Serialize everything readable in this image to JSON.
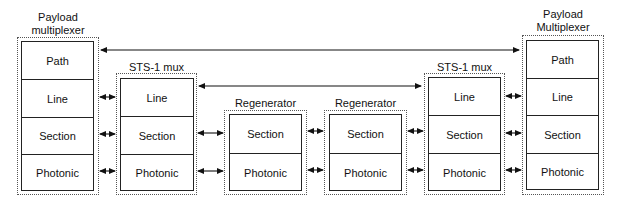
{
  "diagram": {
    "nodes": [
      {
        "id": "pm_left",
        "title_lines": [
          "Payload",
          "multiplexer"
        ],
        "layers": [
          "Path",
          "Line",
          "Section",
          "Photonic"
        ]
      },
      {
        "id": "mux_left",
        "title_lines": [
          "STS-1 mux"
        ],
        "layers": [
          "Line",
          "Section",
          "Photonic"
        ]
      },
      {
        "id": "regen_1",
        "title_lines": [
          "Regenerator"
        ],
        "layers": [
          "Section",
          "Photonic"
        ]
      },
      {
        "id": "regen_2",
        "title_lines": [
          "Regenerator"
        ],
        "layers": [
          "Section",
          "Photonic"
        ]
      },
      {
        "id": "mux_right",
        "title_lines": [
          "STS-1 mux"
        ],
        "layers": [
          "Line",
          "Section",
          "Photonic"
        ]
      },
      {
        "id": "pm_right",
        "title_lines": [
          "Payload",
          "Multiplexer"
        ],
        "layers": [
          "Path",
          "Line",
          "Section",
          "Photonic"
        ]
      }
    ],
    "edges": [
      {
        "from": "pm_left.Path",
        "to": "pm_right.Path",
        "type": "bidirectional"
      },
      {
        "from": "mux_left.Line",
        "to": "mux_right.Line",
        "type": "bidirectional"
      },
      {
        "from": "pm_left.Line",
        "to": "mux_left.Line",
        "type": "bidirectional"
      },
      {
        "from": "pm_left.Section",
        "to": "mux_left.Section",
        "type": "bidirectional"
      },
      {
        "from": "pm_left.Photonic",
        "to": "mux_left.Photonic",
        "type": "bidirectional"
      },
      {
        "from": "mux_left.Section",
        "to": "regen_1.Section",
        "type": "bidirectional"
      },
      {
        "from": "mux_left.Photonic",
        "to": "regen_1.Photonic",
        "type": "bidirectional"
      },
      {
        "from": "regen_1.Section",
        "to": "regen_2.Section",
        "type": "bidirectional"
      },
      {
        "from": "regen_1.Photonic",
        "to": "regen_2.Photonic",
        "type": "bidirectional"
      },
      {
        "from": "regen_2.Section",
        "to": "mux_right.Section",
        "type": "bidirectional"
      },
      {
        "from": "regen_2.Photonic",
        "to": "mux_right.Photonic",
        "type": "bidirectional"
      },
      {
        "from": "mux_right.Line",
        "to": "pm_right.Line",
        "type": "bidirectional"
      },
      {
        "from": "mux_right.Section",
        "to": "pm_right.Section",
        "type": "bidirectional"
      },
      {
        "from": "mux_right.Photonic",
        "to": "pm_right.Photonic",
        "type": "bidirectional"
      }
    ]
  }
}
